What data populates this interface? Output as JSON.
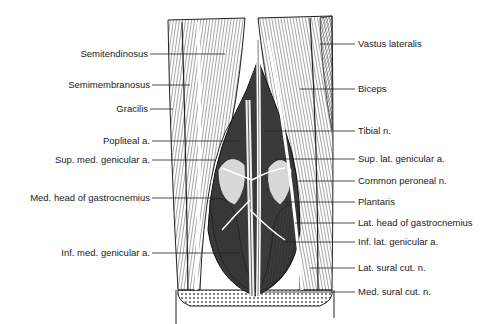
{
  "figure": {
    "left_labels": [
      {
        "text": "Semitendinosus",
        "y": 54
      },
      {
        "text": "Semimembranosus",
        "y": 85
      },
      {
        "text": "Gracilis",
        "y": 109
      },
      {
        "text": "Popliteal a.",
        "y": 141
      },
      {
        "text": "Sup. med. genicular a.",
        "y": 160
      },
      {
        "text": "Med. head of gastrocnemius",
        "y": 198
      },
      {
        "text": "Inf. med. genicular a.",
        "y": 253
      }
    ],
    "right_labels": [
      {
        "text": "Vastus lateralis",
        "y": 44
      },
      {
        "text": "Biceps",
        "y": 89
      },
      {
        "text": "Tibial n.",
        "y": 131
      },
      {
        "text": "Sup. lat. genicular a.",
        "y": 159
      },
      {
        "text": "Common peroneal n.",
        "y": 181
      },
      {
        "text": "Plantaris",
        "y": 202
      },
      {
        "text": "Lat. head of gastrocnemius",
        "y": 223
      },
      {
        "text": "Inf. lat. genicular a.",
        "y": 242
      },
      {
        "text": "Lat. sural cut. n.",
        "y": 268
      },
      {
        "text": "Med. sural cut. n.",
        "y": 292
      }
    ]
  }
}
